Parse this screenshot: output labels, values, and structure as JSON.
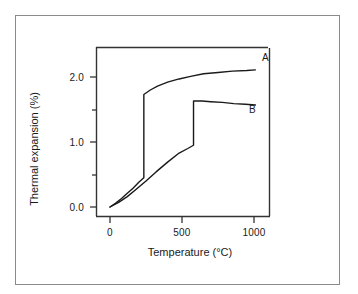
{
  "chart_data": {
    "type": "line",
    "title": "",
    "xlabel": "Temperature (°C)",
    "ylabel": "Thermal expansion (%)",
    "xlim": [
      -40,
      1120
    ],
    "ylim": [
      -0.18,
      2.42
    ],
    "xticks": [
      0,
      500,
      1000
    ],
    "xtick_labels": [
      "0",
      "500",
      "1000"
    ],
    "yticks": [
      0.0,
      1.0,
      2.0
    ],
    "ytick_labels": [
      "0.0",
      "1.0",
      "2.0"
    ],
    "yminor_ticks": [
      0.5,
      1.5
    ],
    "grid": false,
    "legend_position": "inline-right",
    "series": [
      {
        "name": "A",
        "label": "A",
        "color": "#1a1a1a",
        "discontinuity_temperature": 235,
        "discontinuity_from": 0.45,
        "discontinuity_to": 1.73,
        "points": [
          [
            0,
            0.0
          ],
          [
            40,
            0.06
          ],
          [
            80,
            0.13
          ],
          [
            120,
            0.21
          ],
          [
            160,
            0.29
          ],
          [
            200,
            0.38
          ],
          [
            235,
            0.45
          ],
          [
            235,
            1.73
          ],
          [
            280,
            1.8
          ],
          [
            330,
            1.86
          ],
          [
            400,
            1.92
          ],
          [
            480,
            1.97
          ],
          [
            560,
            2.01
          ],
          [
            650,
            2.05
          ],
          [
            750,
            2.07
          ],
          [
            850,
            2.09
          ],
          [
            950,
            2.1
          ],
          [
            1010,
            2.11
          ]
        ]
      },
      {
        "name": "B",
        "label": "B",
        "color": "#1a1a1a",
        "discontinuity_temperature": 580,
        "discontinuity_from": 0.95,
        "discontinuity_to": 1.63,
        "points": [
          [
            0,
            0.0
          ],
          [
            60,
            0.07
          ],
          [
            120,
            0.16
          ],
          [
            180,
            0.27
          ],
          [
            250,
            0.4
          ],
          [
            320,
            0.54
          ],
          [
            400,
            0.69
          ],
          [
            480,
            0.83
          ],
          [
            540,
            0.9
          ],
          [
            580,
            0.95
          ],
          [
            580,
            1.63
          ],
          [
            640,
            1.63
          ],
          [
            700,
            1.62
          ],
          [
            780,
            1.61
          ],
          [
            860,
            1.59
          ],
          [
            940,
            1.58
          ],
          [
            1010,
            1.57
          ]
        ]
      }
    ]
  },
  "axes": {
    "left_spine": true,
    "bottom_spine": true,
    "top_spine": true,
    "right_spine": true
  }
}
